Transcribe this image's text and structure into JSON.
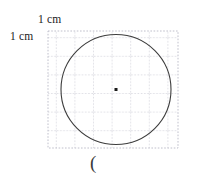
{
  "figure": {
    "kind": "geometry-diagram",
    "labels": {
      "top_label": "1 cm",
      "left_label": "1 cm",
      "bottom_text": "("
    },
    "grid": {
      "x": 48,
      "y": 31,
      "cell_size": 18.6,
      "cols": 7,
      "rows": 6.3,
      "width": 130,
      "height": 117,
      "line_color": "#b9b9c6",
      "line_style": "dotted",
      "unit": "1 cm"
    },
    "circle": {
      "center_x": 116,
      "center_y": 89.5,
      "radius": 55,
      "stroke_color": "#3d3d3d",
      "stroke_width": 1.1,
      "fill": "none"
    },
    "center_dot": {
      "x": 116,
      "y": 89.5,
      "size": 3,
      "color": "#1a1a1a"
    }
  }
}
